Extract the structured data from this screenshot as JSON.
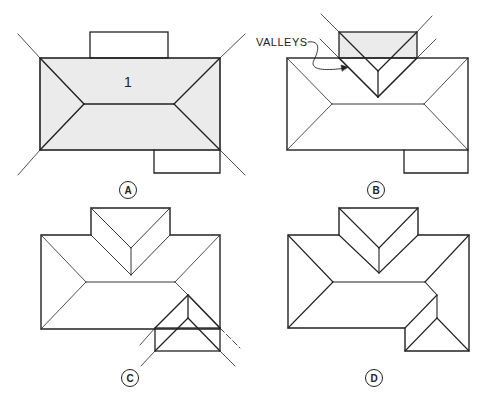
{
  "colors": {
    "line": "#222222",
    "shade": "#ebebeb",
    "background": "#ffffff"
  },
  "panels": [
    {
      "id": "A",
      "label": "A",
      "area_number": "1"
    },
    {
      "id": "B",
      "label": "B",
      "annotation": "VALLEYS"
    },
    {
      "id": "C",
      "label": "C"
    },
    {
      "id": "D",
      "label": "D"
    }
  ]
}
